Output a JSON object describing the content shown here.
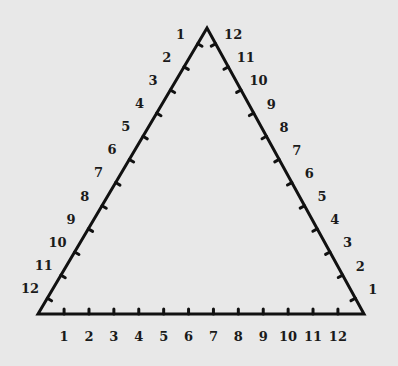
{
  "diagram": {
    "title": "",
    "shape": "equilateral-triangle",
    "colors": {
      "background": "#e8e8e8",
      "stroke": "#111111",
      "text": "#1a1a1a"
    },
    "vertices": {
      "top": [
        207,
        28
      ],
      "bottom_left": [
        38,
        314
      ],
      "bottom_right": [
        364,
        314
      ]
    },
    "ticks_per_side": 12,
    "left_side": {
      "direction": "top-to-bottom",
      "labels": [
        "1",
        "2",
        "3",
        "4",
        "5",
        "6",
        "7",
        "8",
        "9",
        "10",
        "11",
        "12"
      ]
    },
    "right_side": {
      "direction": "top-to-bottom",
      "labels": [
        "12",
        "11",
        "10",
        "9",
        "8",
        "7",
        "6",
        "5",
        "4",
        "3",
        "2",
        "1"
      ]
    },
    "bottom_side": {
      "direction": "left-to-right",
      "labels": [
        "1",
        "2",
        "3",
        "4",
        "5",
        "6",
        "7",
        "8",
        "9",
        "10",
        "11",
        "12"
      ]
    }
  }
}
